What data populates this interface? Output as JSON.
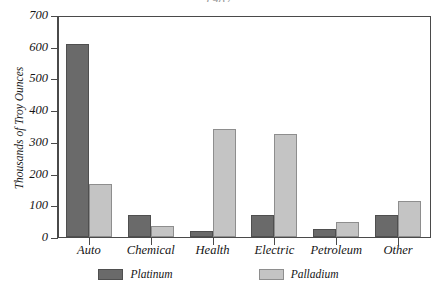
{
  "chart_data": {
    "type": "bar",
    "title": "1987",
    "xlabel": "",
    "ylabel": "Thousands of Troy Ounces",
    "ylim": [
      0,
      700
    ],
    "yticks": [
      0,
      100,
      200,
      300,
      400,
      500,
      600,
      700
    ],
    "grid": false,
    "legend_position": "bottom",
    "categories": [
      "Auto",
      "Chemical",
      "Health",
      "Electric",
      "Petroleum",
      "Other"
    ],
    "series": [
      {
        "name": "Platinum",
        "color": "#6a6a6a",
        "values": [
          608,
          70,
          19,
          69,
          25,
          69
        ]
      },
      {
        "name": "Palladium",
        "color": "#c4c4c4",
        "values": [
          167,
          35,
          340,
          325,
          47,
          113
        ]
      }
    ]
  },
  "axis": {
    "ytick_labels": [
      "700",
      "600",
      "500",
      "400",
      "300",
      "200",
      "100",
      "0"
    ]
  }
}
